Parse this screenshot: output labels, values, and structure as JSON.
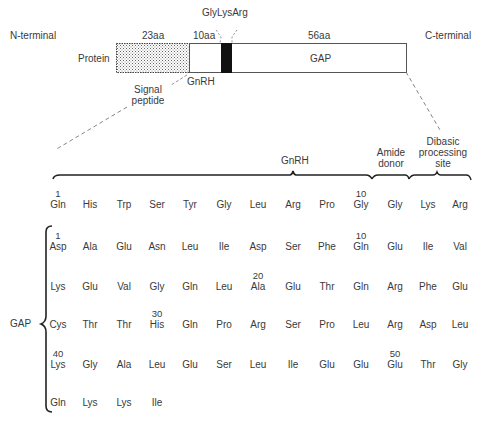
{
  "top": {
    "n_terminal": "N-terminal",
    "c_terminal": "C-terminal",
    "len_signal": "23aa",
    "len_gnrh": "10aa",
    "len_gap": "56aa",
    "cleavage_label": "GlyLysArg",
    "protein_label": "Protein",
    "gap_label": "GAP",
    "gnrh_label": "GnRH",
    "signal_label_1": "Signal",
    "signal_label_2": "peptide"
  },
  "detail": {
    "gnrh_bracket_label": "GnRH",
    "amide_label_1": "Amide",
    "amide_label_2": "donor",
    "dibasic_label_1": "Dibasic",
    "dibasic_label_2": "processing",
    "dibasic_label_3": "site",
    "gap_side_label": "GAP",
    "gnrh_row": [
      {
        "num": "1",
        "aa": "Gln"
      },
      {
        "num": "",
        "aa": "His"
      },
      {
        "num": "",
        "aa": "Trp"
      },
      {
        "num": "",
        "aa": "Ser"
      },
      {
        "num": "",
        "aa": "Tyr"
      },
      {
        "num": "",
        "aa": "Gly"
      },
      {
        "num": "",
        "aa": "Leu"
      },
      {
        "num": "",
        "aa": "Arg"
      },
      {
        "num": "",
        "aa": "Pro"
      },
      {
        "num": "10",
        "aa": "Gly"
      },
      {
        "num": "",
        "aa": "Gly"
      },
      {
        "num": "",
        "aa": "Lys"
      },
      {
        "num": "",
        "aa": "Arg"
      }
    ],
    "gap_rows": [
      [
        {
          "num": "1",
          "aa": "Asp"
        },
        {
          "num": "",
          "aa": "Ala"
        },
        {
          "num": "",
          "aa": "Glu"
        },
        {
          "num": "",
          "aa": "Asn"
        },
        {
          "num": "",
          "aa": "Leu"
        },
        {
          "num": "",
          "aa": "Ile"
        },
        {
          "num": "",
          "aa": "Asp"
        },
        {
          "num": "",
          "aa": "Ser"
        },
        {
          "num": "",
          "aa": "Phe"
        },
        {
          "num": "10",
          "aa": "Gln"
        },
        {
          "num": "",
          "aa": "Glu"
        },
        {
          "num": "",
          "aa": "Ile"
        },
        {
          "num": "",
          "aa": "Val"
        }
      ],
      [
        {
          "num": "",
          "aa": "Lys"
        },
        {
          "num": "",
          "aa": "Glu"
        },
        {
          "num": "",
          "aa": "Val"
        },
        {
          "num": "",
          "aa": "Gly"
        },
        {
          "num": "",
          "aa": "Gln"
        },
        {
          "num": "",
          "aa": "Leu"
        },
        {
          "num": "20",
          "aa": "Ala"
        },
        {
          "num": "",
          "aa": "Glu"
        },
        {
          "num": "",
          "aa": "Thr"
        },
        {
          "num": "",
          "aa": "Gln"
        },
        {
          "num": "",
          "aa": "Arg"
        },
        {
          "num": "",
          "aa": "Phe"
        },
        {
          "num": "",
          "aa": "Glu"
        }
      ],
      [
        {
          "num": "",
          "aa": "Cys"
        },
        {
          "num": "",
          "aa": "Thr"
        },
        {
          "num": "",
          "aa": "Thr"
        },
        {
          "num": "30",
          "aa": "His"
        },
        {
          "num": "",
          "aa": "Gln"
        },
        {
          "num": "",
          "aa": "Pro"
        },
        {
          "num": "",
          "aa": "Arg"
        },
        {
          "num": "",
          "aa": "Ser"
        },
        {
          "num": "",
          "aa": "Pro"
        },
        {
          "num": "",
          "aa": "Leu"
        },
        {
          "num": "",
          "aa": "Arg"
        },
        {
          "num": "",
          "aa": "Asp"
        },
        {
          "num": "",
          "aa": "Leu"
        }
      ],
      [
        {
          "num": "40",
          "aa": "Lys"
        },
        {
          "num": "",
          "aa": "Gly"
        },
        {
          "num": "",
          "aa": "Ala"
        },
        {
          "num": "",
          "aa": "Leu"
        },
        {
          "num": "",
          "aa": "Glu"
        },
        {
          "num": "",
          "aa": "Ser"
        },
        {
          "num": "",
          "aa": "Leu"
        },
        {
          "num": "",
          "aa": "Ile"
        },
        {
          "num": "",
          "aa": "Glu"
        },
        {
          "num": "",
          "aa": "Glu"
        },
        {
          "num": "50",
          "aa": "Glu"
        },
        {
          "num": "",
          "aa": "Thr"
        },
        {
          "num": "",
          "aa": "Gly"
        }
      ],
      [
        {
          "num": "",
          "aa": "Gln"
        },
        {
          "num": "",
          "aa": "Lys"
        },
        {
          "num": "",
          "aa": "Lys"
        },
        {
          "num": "",
          "aa": "Ile"
        }
      ]
    ]
  },
  "colors": {
    "text": "#3a3a3a",
    "line": "#555555",
    "black_segment": "#111111"
  }
}
